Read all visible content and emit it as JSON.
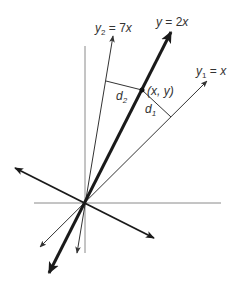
{
  "diagram": {
    "origin": {
      "x": 85,
      "y": 203
    },
    "axes": {
      "vertical": {
        "x1": 85,
        "y1": 46,
        "x2": 85,
        "y2": 253,
        "color": "#888888"
      },
      "horizontal": {
        "x1": 34,
        "y1": 203,
        "x2": 221,
        "y2": 203,
        "color": "#888888"
      }
    },
    "lines": [
      {
        "id": "y-2x",
        "label": "y = 2x",
        "x1": 49,
        "y1": 273,
        "x2": 171,
        "y2": 32,
        "width": 3,
        "color": "#1a1a1a"
      },
      {
        "id": "y2-7x",
        "label": "y2 = 7x",
        "x1": 77,
        "y1": 253,
        "x2": 113,
        "y2": 36,
        "width": 1,
        "color": "#333333"
      },
      {
        "id": "y1-x",
        "label": "y1 = x",
        "x1": 40,
        "y1": 247,
        "x2": 207,
        "y2": 81,
        "width": 1,
        "color": "#333333"
      },
      {
        "id": "perpendicular",
        "label": "",
        "x1": 15,
        "y1": 168,
        "x2": 154,
        "y2": 238,
        "width": 2,
        "color": "#1a1a1a"
      }
    ],
    "point": {
      "label": "(x, y)",
      "x": 142,
      "y": 90
    },
    "distances": [
      {
        "label": "d",
        "sub": "2",
        "from": {
          "x": 142,
          "y": 90
        },
        "to": {
          "x": 106,
          "y": 81
        }
      },
      {
        "label": "d",
        "sub": "1",
        "from": {
          "x": 142,
          "y": 90
        },
        "to": {
          "x": 171,
          "y": 117
        }
      }
    ],
    "labels": {
      "y_2x": {
        "pre": "y",
        "sub": "",
        "post": " = 2",
        "var": "x"
      },
      "y2_7x": {
        "pre": "y",
        "sub": "2",
        "post": " = 7",
        "var": "x"
      },
      "y1_x": {
        "pre": "y",
        "sub": "1",
        "post": " = ",
        "var": "x"
      },
      "point": "(x, y)",
      "d1": {
        "pre": "d",
        "sub": "1"
      },
      "d2": {
        "pre": "d",
        "sub": "2"
      }
    }
  }
}
